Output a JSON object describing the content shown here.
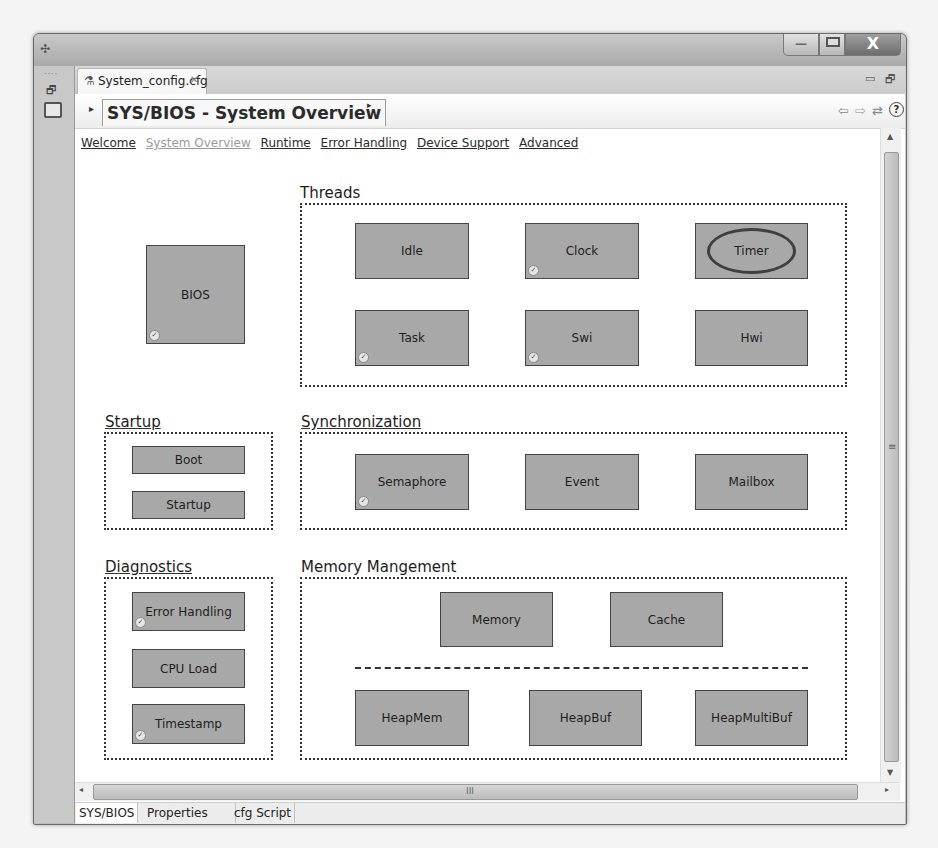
{
  "window": {
    "controls": {
      "minimize": "—",
      "maximize": "□",
      "close": "X"
    }
  },
  "left_strip": {
    "icons": [
      "restore-icon",
      "console-icon"
    ]
  },
  "editor_tab": {
    "label": "System_config.cfg",
    "icon": "cfg-file-icon",
    "close_glyph": "✕"
  },
  "view_controls": {
    "minimize": "▭",
    "maximize": "🗗"
  },
  "header": {
    "title": "SYS/BIOS - System Overview",
    "left_arrow": "▸",
    "right_arrow": "▸",
    "nav": {
      "back": "⇦",
      "forward": "⇨",
      "sync": "⇄",
      "help": "?"
    }
  },
  "links": [
    {
      "label": "Welcome",
      "current": false
    },
    {
      "label": "System Overview",
      "current": true
    },
    {
      "label": "Runtime",
      "current": false
    },
    {
      "label": "Error Handling",
      "current": false
    },
    {
      "label": "Device Support",
      "current": false
    },
    {
      "label": "Advanced",
      "current": false
    }
  ],
  "diagram": {
    "bios": {
      "label": "BIOS",
      "enabled": true
    },
    "groups": {
      "threads": {
        "title": "Threads",
        "modules": [
          {
            "label": "Idle",
            "enabled": false
          },
          {
            "label": "Clock",
            "enabled": true
          },
          {
            "label": "Timer",
            "enabled": false,
            "highlighted": true
          },
          {
            "label": "Task",
            "enabled": true
          },
          {
            "label": "Swi",
            "enabled": true
          },
          {
            "label": "Hwi",
            "enabled": false
          }
        ]
      },
      "startup": {
        "title": "Startup",
        "modules": [
          {
            "label": "Boot",
            "enabled": false
          },
          {
            "label": "Startup",
            "enabled": false
          }
        ]
      },
      "synchronization": {
        "title": "Synchronization",
        "modules": [
          {
            "label": "Semaphore",
            "enabled": true
          },
          {
            "label": "Event",
            "enabled": false
          },
          {
            "label": "Mailbox",
            "enabled": false
          }
        ]
      },
      "diagnostics": {
        "title": "Diagnostics",
        "modules": [
          {
            "label": "Error Handling",
            "enabled": true
          },
          {
            "label": "CPU Load",
            "enabled": false
          },
          {
            "label": "Timestamp",
            "enabled": true
          }
        ]
      },
      "memory": {
        "title": "Memory Mangement",
        "modules": [
          {
            "label": "Memory",
            "enabled": false
          },
          {
            "label": "Cache",
            "enabled": false
          },
          {
            "label": "HeapMem",
            "enabled": false
          },
          {
            "label": "HeapBuf",
            "enabled": false
          },
          {
            "label": "HeapMultiBuf",
            "enabled": false
          }
        ]
      }
    },
    "check_glyph": "✓"
  },
  "scrollbars": {
    "up": "▲",
    "down": "▼",
    "left": "◂",
    "right": "▸",
    "vgrip": "≡",
    "hgrip": "III"
  },
  "bottom_tabs": [
    {
      "label": "SYS/BIOS",
      "active": true
    },
    {
      "label": "Properties",
      "active": false
    },
    {
      "label": "cfg Script",
      "active": false
    }
  ]
}
